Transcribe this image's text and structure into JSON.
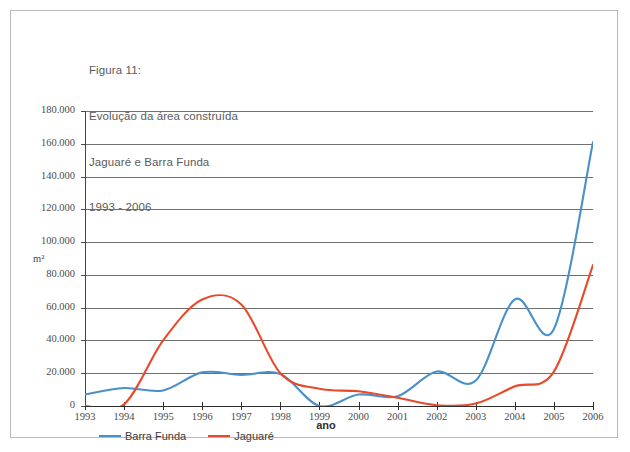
{
  "caption": {
    "line1": "Figura 11:",
    "line2": "Evolução da área construída",
    "line3": "Jaguaré e Barra Funda",
    "line4": "1993 - 2006"
  },
  "legend": {
    "items": [
      {
        "label": "Barra Funda",
        "color": "#4a90c8"
      },
      {
        "label": "Jaguaré",
        "color": "#e8492a"
      }
    ]
  },
  "chart_data": {
    "type": "line",
    "title": "Evolução da área construída Jaguaré e Barra Funda 1993 - 2006",
    "xlabel": "ano",
    "ylabel": "m²",
    "x": [
      1993,
      1994,
      1995,
      1996,
      1997,
      1998,
      1999,
      2000,
      2001,
      2002,
      2003,
      2004,
      2005,
      2006
    ],
    "categories": [
      "1993",
      "1994",
      "1995",
      "1996",
      "1997",
      "1998",
      "1999",
      "2000",
      "2001",
      "2002",
      "2003",
      "2004",
      "2005",
      "2006"
    ],
    "xlim": [
      1993,
      2006
    ],
    "ylim": [
      0,
      180000
    ],
    "yticks": [
      0,
      20000,
      40000,
      60000,
      80000,
      100000,
      120000,
      140000,
      160000,
      180000
    ],
    "ytick_labels": [
      "0",
      "20.000",
      "40.000",
      "60.000",
      "80.000",
      "100.000",
      "120.000",
      "140.000",
      "160.000",
      "180.000"
    ],
    "grid": true,
    "legend_position": "bottom-left",
    "smoothing": "spline",
    "series": [
      {
        "name": "Barra Funda",
        "color": "#4a90c8",
        "values": [
          7000,
          11000,
          9500,
          20500,
          19000,
          19500,
          0,
          7000,
          6000,
          21000,
          15500,
          65000,
          47000,
          161000
        ]
      },
      {
        "name": "Jaguaré",
        "color": "#e8492a",
        "values": [
          0,
          1000,
          40000,
          65000,
          62000,
          20000,
          10500,
          9000,
          5000,
          500,
          1500,
          12000,
          21000,
          86000
        ]
      }
    ]
  }
}
